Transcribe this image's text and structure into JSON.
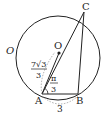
{
  "diagram": {
    "circle_label": "O",
    "center_label": "O",
    "points": {
      "A": "A",
      "B": "B",
      "C": "C"
    },
    "segment_AO_length": {
      "numerator": "7√3",
      "denominator": "3"
    },
    "angle_OAB": {
      "numerator": "π",
      "denominator": "3"
    },
    "segment_AB_length": "3",
    "colors": {
      "stroke": "#222222",
      "dashed": "#888888",
      "background": "#ffffff"
    }
  }
}
